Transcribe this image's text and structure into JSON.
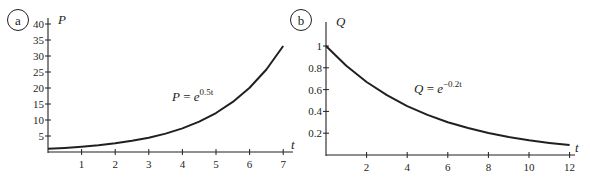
{
  "chart_data": [
    {
      "id": "a",
      "type": "line",
      "panel_label": "a",
      "title": "",
      "xlabel": "t",
      "ylabel": "P",
      "equation": {
        "lhs": "P",
        "eq": " = ",
        "base": "e",
        "exponent": "0.5t"
      },
      "xlim": [
        0,
        7
      ],
      "ylim": [
        0,
        40
      ],
      "x_ticks": [
        1,
        2,
        3,
        4,
        5,
        6,
        7
      ],
      "y_ticks": [
        5,
        10,
        15,
        20,
        25,
        30,
        35,
        40
      ],
      "grid": false,
      "legend": "none",
      "x": [
        0,
        0.5,
        1,
        1.5,
        2,
        2.5,
        3,
        3.5,
        4,
        4.5,
        5,
        5.5,
        6,
        6.5,
        7
      ],
      "series": [
        {
          "name": "P = e^(0.5t)",
          "values": [
            1.0,
            1.28,
            1.65,
            2.12,
            2.72,
            3.49,
            4.48,
            5.75,
            7.39,
            9.49,
            12.18,
            15.64,
            20.09,
            25.79,
            33.12
          ]
        }
      ]
    },
    {
      "id": "b",
      "type": "line",
      "panel_label": "b",
      "title": "",
      "xlabel": "t",
      "ylabel": "Q",
      "equation": {
        "lhs": "Q",
        "eq": " = ",
        "base": "e",
        "exponent": "−0.2t"
      },
      "xlim": [
        0,
        12
      ],
      "ylim": [
        0,
        1
      ],
      "x_ticks": [
        2,
        4,
        6,
        8,
        10,
        12
      ],
      "y_ticks": [
        0.2,
        0.4,
        0.6,
        0.8,
        1
      ],
      "grid": false,
      "legend": "none",
      "x": [
        0,
        1,
        2,
        3,
        4,
        5,
        6,
        7,
        8,
        9,
        10,
        11,
        12
      ],
      "series": [
        {
          "name": "Q = e^(-0.2t)",
          "values": [
            1.0,
            0.819,
            0.67,
            0.549,
            0.449,
            0.368,
            0.301,
            0.247,
            0.202,
            0.165,
            0.135,
            0.111,
            0.091
          ]
        }
      ]
    }
  ]
}
